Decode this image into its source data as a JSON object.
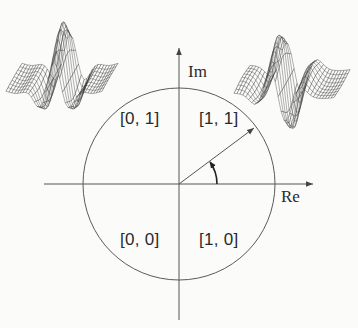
{
  "figure": {
    "axes": {
      "real_label": "Re",
      "imag_label": "Im"
    },
    "unit_circle": {
      "center": [
        179,
        184
      ],
      "radius": 96
    },
    "quadrants": [
      {
        "id": "q-0-1",
        "label": "[0, 1]"
      },
      {
        "id": "q-1-1",
        "label": "[1, 1]"
      },
      {
        "id": "q-0-0",
        "label": "[0, 0]"
      },
      {
        "id": "q-1-0",
        "label": "[1, 0]"
      }
    ],
    "phasor": {
      "description": "radius vector from origin to the unit circle with phase-angle arc"
    },
    "surfaces": [
      {
        "id": "real-part",
        "shape": "even-symmetric wavelet (central peak, side troughs)"
      },
      {
        "id": "imag-part",
        "shape": "odd-symmetric wavelet (peak followed by trough)"
      }
    ],
    "colors": {
      "line": "#555555",
      "text": "#2a2a2a",
      "mesh": "#3a3a3a",
      "background": "#fbfbfa"
    }
  }
}
